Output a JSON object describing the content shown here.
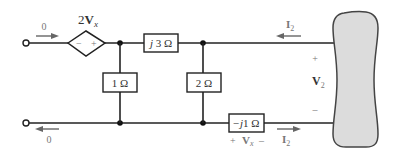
{
  "diagram": {
    "type": "circuit",
    "elements": {
      "dependent_source": {
        "label_coef": "2",
        "label_var": "V",
        "label_sub": "x",
        "minus": "−",
        "plus": "+"
      },
      "series_impedance_top": {
        "label": "j3 Ω",
        "j": "j",
        "value": "3 Ω"
      },
      "shunt_resistor_1": {
        "label": "1 Ω"
      },
      "shunt_resistor_2": {
        "label": "2 Ω"
      },
      "series_impedance_bottom": {
        "label": "−j1 Ω",
        "j": "−j",
        "value": "1 Ω"
      },
      "load": {
        "label": "network"
      }
    },
    "annotations": {
      "input_current_top": "0",
      "input_current_bottom": "0",
      "current_top_var": "I",
      "current_top_sub": "2",
      "current_bottom_var": "I",
      "current_bottom_sub": "2",
      "v2_plus": "+",
      "v2_var": "V",
      "v2_sub": "2",
      "v2_minus": "–",
      "vx_plus": "+",
      "vx_var": "V",
      "vx_sub": "x",
      "vx_minus": "–"
    },
    "colors": {
      "wire": "#222222",
      "load_fill": "#dcdcdc",
      "load_stroke": "#444444",
      "arrow": "#666666"
    }
  }
}
